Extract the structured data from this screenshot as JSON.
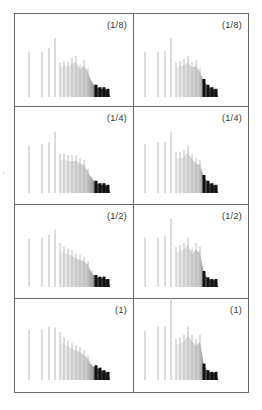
{
  "figure": {
    "layout": "4x2 grid of spectra panels",
    "colors": {
      "frame": "#6a6a6a",
      "line_light": "#bdbdbd",
      "line_dark": "#111111",
      "label": "#333333"
    }
  },
  "chart_data": [
    {
      "type": "bar",
      "panel": "left-row1",
      "label": "(1/8)",
      "x_px": [
        29,
        42,
        49,
        55,
        60,
        64,
        68,
        72,
        76,
        80,
        84,
        88,
        92,
        96,
        100,
        104,
        108
      ],
      "values": [
        0.55,
        0.55,
        0.6,
        0.72,
        0.42,
        0.44,
        0.43,
        0.48,
        0.5,
        0.4,
        0.45,
        0.35,
        0.2,
        0.15,
        0.12,
        0.12,
        0.1
      ],
      "fill_tail": true,
      "xlabel": "",
      "ylabel": ""
    },
    {
      "type": "bar",
      "panel": "right-row1",
      "label": "(1/8)",
      "x_px": [
        145,
        158,
        165,
        171,
        176,
        180,
        184,
        188,
        192,
        196,
        200,
        204,
        208,
        212,
        216
      ],
      "values": [
        0.55,
        0.55,
        0.56,
        0.72,
        0.42,
        0.44,
        0.46,
        0.5,
        0.42,
        0.45,
        0.35,
        0.22,
        0.15,
        0.12,
        0.1
      ],
      "fill_tail": true,
      "xlabel": "",
      "ylabel": ""
    },
    {
      "type": "bar",
      "panel": "left-row2",
      "label": "(1/4)",
      "x_px": [
        29,
        42,
        49,
        55,
        60,
        64,
        68,
        72,
        76,
        80,
        84,
        88,
        92,
        96,
        100,
        104,
        108
      ],
      "values": [
        0.58,
        0.6,
        0.62,
        0.75,
        0.48,
        0.48,
        0.46,
        0.46,
        0.46,
        0.42,
        0.4,
        0.3,
        0.2,
        0.15,
        0.12,
        0.12,
        0.1
      ],
      "fill_tail": true,
      "xlabel": "",
      "ylabel": ""
    },
    {
      "type": "bar",
      "panel": "right-row2",
      "label": "(1/4)",
      "x_px": [
        145,
        158,
        165,
        171,
        176,
        180,
        184,
        188,
        192,
        196,
        200,
        204,
        208,
        212,
        216
      ],
      "values": [
        0.6,
        0.62,
        0.62,
        0.75,
        0.5,
        0.5,
        0.52,
        0.58,
        0.48,
        0.42,
        0.4,
        0.22,
        0.15,
        0.12,
        0.1
      ],
      "fill_tail": true,
      "xlabel": "",
      "ylabel": ""
    },
    {
      "type": "bar",
      "panel": "left-row3",
      "label": "(1/2)",
      "x_px": [
        29,
        42,
        49,
        55,
        60,
        64,
        68,
        72,
        76,
        80,
        84,
        88,
        92,
        96,
        100,
        104,
        108
      ],
      "values": [
        0.6,
        0.62,
        0.65,
        0.72,
        0.55,
        0.5,
        0.48,
        0.46,
        0.42,
        0.4,
        0.38,
        0.32,
        0.2,
        0.15,
        0.13,
        0.13,
        0.1
      ],
      "fill_tail": true,
      "xlabel": "",
      "ylabel": ""
    },
    {
      "type": "bar",
      "panel": "right-row3",
      "label": "(1/2)",
      "x_px": [
        145,
        158,
        165,
        171,
        176,
        180,
        184,
        188,
        192,
        196,
        200,
        204,
        208,
        212,
        216
      ],
      "values": [
        0.62,
        0.62,
        0.64,
        0.85,
        0.5,
        0.52,
        0.55,
        0.62,
        0.48,
        0.55,
        0.5,
        0.2,
        0.12,
        0.1,
        0.1
      ],
      "fill_tail": true,
      "xlabel": "",
      "ylabel": ""
    },
    {
      "type": "bar",
      "panel": "left-row4",
      "label": "(1)",
      "x_px": [
        29,
        42,
        49,
        55,
        60,
        64,
        68,
        72,
        76,
        80,
        84,
        88,
        92,
        96,
        100,
        104,
        108
      ],
      "values": [
        0.62,
        0.62,
        0.65,
        0.64,
        0.58,
        0.52,
        0.48,
        0.45,
        0.42,
        0.4,
        0.36,
        0.3,
        0.2,
        0.18,
        0.15,
        0.12,
        0.1
      ],
      "fill_tail": true,
      "xlabel": "",
      "ylabel": ""
    },
    {
      "type": "bar",
      "panel": "right-row4",
      "label": "(1)",
      "x_px": [
        145,
        158,
        165,
        171,
        176,
        180,
        184,
        188,
        192,
        196,
        200,
        204,
        208,
        212,
        216
      ],
      "values": [
        0.6,
        0.65,
        0.65,
        1.0,
        0.5,
        0.52,
        0.55,
        0.65,
        0.55,
        0.5,
        0.55,
        0.2,
        0.12,
        0.1,
        0.1
      ],
      "fill_tail": true,
      "xlabel": "",
      "ylabel": ""
    }
  ],
  "panels": [
    {
      "label": "(1/8)"
    },
    {
      "label": "(1/8)"
    },
    {
      "label": "(1/4)"
    },
    {
      "label": "(1/4)"
    },
    {
      "label": "(1/2)"
    },
    {
      "label": "(1/2)"
    },
    {
      "label": "(1)"
    },
    {
      "label": "(1)"
    }
  ]
}
